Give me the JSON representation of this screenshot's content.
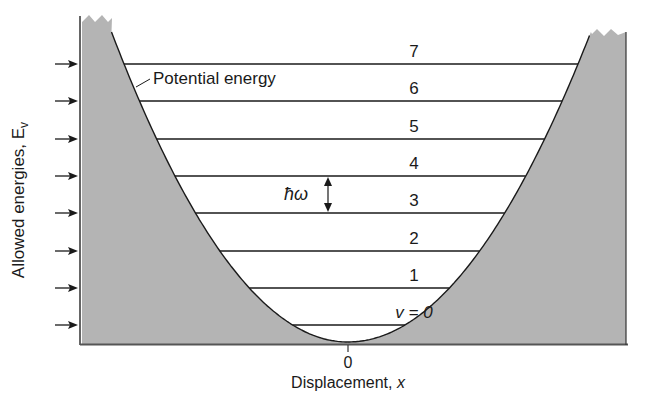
{
  "colors": {
    "well_fill": "#b4b4b4",
    "line": "#1a1a1a",
    "background": "#ffffff"
  },
  "labels": {
    "potential_energy": "Potential energy",
    "y_axis": "Allowed energies, E",
    "y_axis_subscript": "v",
    "x_axis": "Displacement, ",
    "x_axis_var": "x",
    "x_origin_tick": "0",
    "spacing": "ħω"
  },
  "energy_levels": [
    {
      "v": 0,
      "label": "v = 0",
      "y": 325
    },
    {
      "v": 1,
      "label": "1",
      "y": 288
    },
    {
      "v": 2,
      "label": "2",
      "y": 251
    },
    {
      "v": 3,
      "label": "3",
      "y": 213
    },
    {
      "v": 4,
      "label": "4",
      "y": 176
    },
    {
      "v": 5,
      "label": "5",
      "y": 139
    },
    {
      "v": 6,
      "label": "6",
      "y": 101
    },
    {
      "v": 7,
      "label": "7",
      "y": 64
    }
  ],
  "left_arrows_count": 8
}
